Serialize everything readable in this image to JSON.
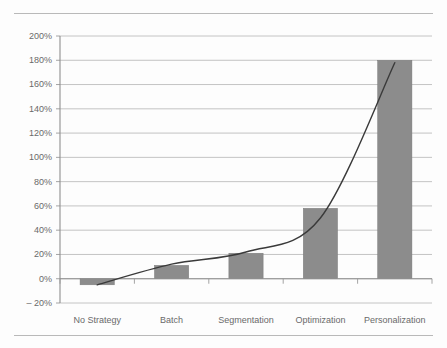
{
  "document": {
    "top_rule": "horizontal-rule",
    "bottom_rule": "horizontal-rule"
  },
  "chart_data": {
    "type": "bar",
    "title": "",
    "subtitle": "",
    "xlabel": "",
    "ylabel": "",
    "categories": [
      "No Strategy",
      "Batch",
      "Segmentation",
      "Optimization",
      "Personalization"
    ],
    "values": [
      -5,
      11,
      21,
      58,
      180
    ],
    "value_format": "percent",
    "ylim": [
      -20,
      200
    ],
    "ytick_values": [
      200,
      180,
      160,
      140,
      120,
      100,
      80,
      60,
      40,
      20,
      0,
      -20
    ],
    "ytick_labels": [
      "200%",
      "180%",
      "160%",
      "140%",
      "120%",
      "100%",
      "80%",
      "60%",
      "40%",
      "20%",
      "0%",
      "– 20%"
    ],
    "grid": true,
    "legend": false,
    "legend_position": "none",
    "bar_color": "#8c8c8c",
    "grid_color": "#b5b5b5",
    "axis_color": "#8f8f8f",
    "series": [
      {
        "name": "Lift",
        "type": "bar",
        "values": [
          -5,
          11,
          21,
          58,
          180
        ]
      },
      {
        "name": "Trend",
        "type": "line",
        "values": [
          -5,
          12,
          22,
          50,
          178
        ]
      }
    ],
    "annotations": []
  }
}
